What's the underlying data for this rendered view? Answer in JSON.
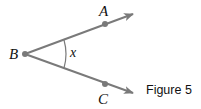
{
  "figure": {
    "caption": "Figure 5",
    "points": {
      "A": "A",
      "B": "B",
      "C": "C"
    },
    "angle_label": "x",
    "colors": {
      "ray": "#7a7a7a",
      "text": "#111111"
    }
  }
}
